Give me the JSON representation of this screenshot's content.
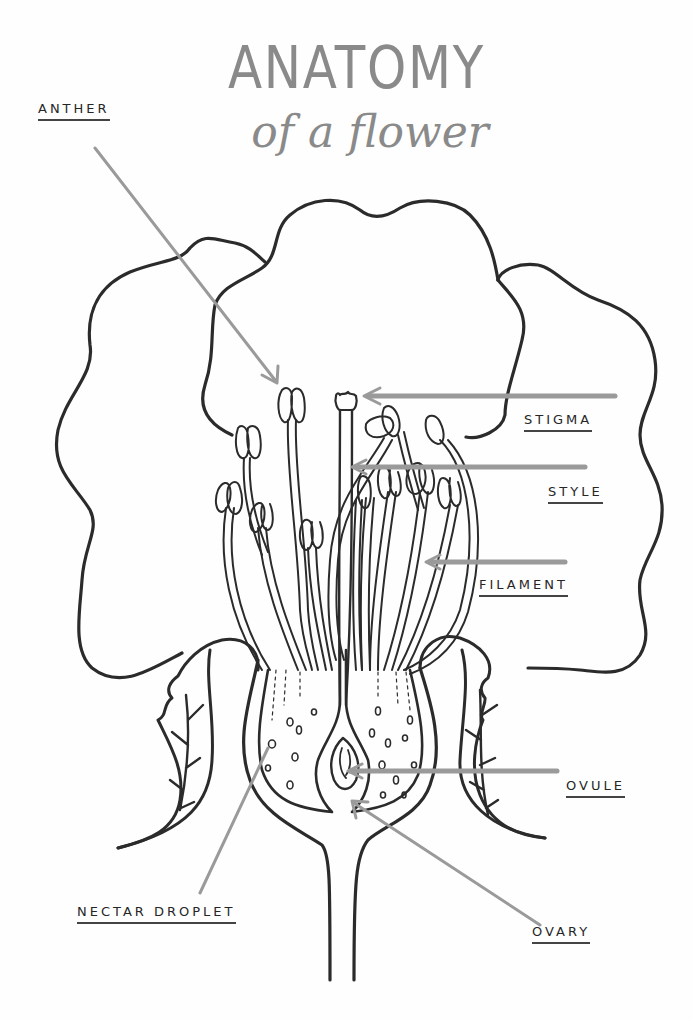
{
  "title": {
    "main": "ANATOMY",
    "sub": "of a flower"
  },
  "labels": {
    "anther": "ANTHER",
    "stigma": "STIGMA",
    "style": "STYLE",
    "filament": "FILAMENT",
    "ovule": "OVULE",
    "nectar_droplet": "NECTAR DROPLET",
    "ovary": "OVARY"
  },
  "colors": {
    "ink": "#2b2b2b",
    "pointer": "#9a9a9a",
    "title": "#8a8a8a",
    "background": "#fefefe"
  }
}
